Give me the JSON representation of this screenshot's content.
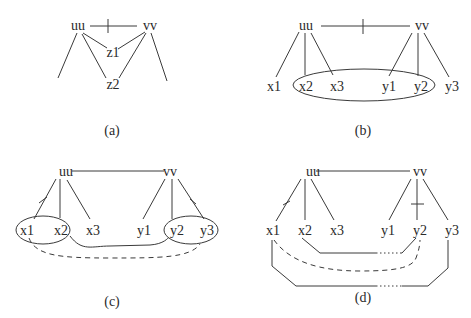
{
  "panels": {
    "a": {
      "caption": "(a)",
      "nodes": {
        "uu": "uu",
        "vv": "vv",
        "z1": "z1",
        "z2": "z2"
      },
      "edges": [
        {
          "from": "uu",
          "to": "vv",
          "style": "solid",
          "marked": true
        },
        {
          "from": "uu",
          "to": "z1",
          "style": "solid"
        },
        {
          "from": "uu",
          "to": "z2",
          "style": "solid"
        },
        {
          "from": "vv",
          "to": "z1",
          "style": "solid"
        },
        {
          "from": "vv",
          "to": "z2",
          "style": "solid"
        },
        {
          "from": "uu",
          "to": "(off-left)",
          "style": "solid"
        },
        {
          "from": "vv",
          "to": "(off-right)",
          "style": "solid"
        }
      ]
    },
    "b": {
      "caption": "(b)",
      "nodes": {
        "uu": "uu",
        "vv": "vv",
        "x1": "x1",
        "x2": "x2",
        "x3": "x3",
        "y1": "y1",
        "y2": "y2",
        "y3": "y3"
      },
      "groups": [
        [
          "x2",
          "x3",
          "y1",
          "y2"
        ]
      ],
      "edges": [
        {
          "from": "uu",
          "to": "vv",
          "style": "solid",
          "marked": true
        },
        {
          "from": "uu",
          "to": "x1",
          "style": "solid"
        },
        {
          "from": "uu",
          "to": "x2",
          "style": "solid"
        },
        {
          "from": "uu",
          "to": "x3",
          "style": "solid"
        },
        {
          "from": "vv",
          "to": "y1",
          "style": "solid"
        },
        {
          "from": "vv",
          "to": "y2",
          "style": "solid"
        },
        {
          "from": "vv",
          "to": "y3",
          "style": "solid"
        }
      ]
    },
    "c": {
      "caption": "(c)",
      "nodes": {
        "uu": "uu",
        "vv": "vv",
        "x1": "x1",
        "x2": "x2",
        "x3": "x3",
        "y1": "y1",
        "y2": "y2",
        "y3": "y3"
      },
      "groups": [
        [
          "x1",
          "x2"
        ],
        [
          "y2",
          "y3"
        ]
      ],
      "edges": [
        {
          "from": "uu",
          "to": "vv",
          "style": "solid"
        },
        {
          "from": "uu",
          "to": "x1",
          "style": "solid",
          "marked": true
        },
        {
          "from": "uu",
          "to": "x2",
          "style": "solid"
        },
        {
          "from": "uu",
          "to": "x3",
          "style": "solid"
        },
        {
          "from": "vv",
          "to": "y1",
          "style": "solid"
        },
        {
          "from": "vv",
          "to": "y2",
          "style": "solid"
        },
        {
          "from": "vv",
          "to": "y3",
          "style": "solid",
          "marked": true
        },
        {
          "from": "x2",
          "to": "y2",
          "style": "solid-curve"
        },
        {
          "from": "x1",
          "to": "y3",
          "style": "dashed-curve"
        }
      ]
    },
    "d": {
      "caption": "(d)",
      "nodes": {
        "uu": "uu",
        "vv": "vv",
        "x1": "x1",
        "x2": "x2",
        "x3": "x3",
        "y1": "y1",
        "y2": "y2",
        "y3": "y3"
      },
      "edges": [
        {
          "from": "uu",
          "to": "vv",
          "style": "solid"
        },
        {
          "from": "uu",
          "to": "x1",
          "style": "solid",
          "marked": true
        },
        {
          "from": "uu",
          "to": "x2",
          "style": "solid"
        },
        {
          "from": "uu",
          "to": "x3",
          "style": "solid"
        },
        {
          "from": "vv",
          "to": "y1",
          "style": "solid"
        },
        {
          "from": "vv",
          "to": "y2",
          "style": "solid",
          "marked": true
        },
        {
          "from": "vv",
          "to": "y3",
          "style": "solid"
        },
        {
          "from": "x2",
          "to": "y2",
          "style": "path-with-dotted-gap"
        },
        {
          "from": "x1",
          "to": "y2",
          "style": "dashed-curve"
        },
        {
          "from": "x1",
          "to": "y3",
          "style": "path-with-dotted-gap"
        }
      ]
    }
  }
}
